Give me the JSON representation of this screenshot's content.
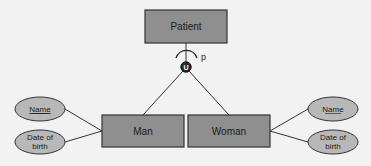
{
  "diagram": {
    "type": "EER generalization/specialization",
    "colors": {
      "background": "#f2f2f2",
      "entity_fill": "#8f8f8f",
      "attribute_fill": "#b8b8b8",
      "stroke": "#333333",
      "union_circle": "#2a2a2a"
    },
    "superclass": {
      "label": "Patient"
    },
    "specialization": {
      "symbol": "U",
      "participation_label": "p"
    },
    "subclasses": [
      {
        "label": "Man",
        "attributes": [
          {
            "label": "Name",
            "key": true
          },
          {
            "label_line1": "Date of",
            "label_line2": "birth",
            "key": false
          }
        ]
      },
      {
        "label": "Woman",
        "attributes": [
          {
            "label": "Name",
            "key": true
          },
          {
            "label_line1": "Date of",
            "label_line2": "birth",
            "key": false
          }
        ]
      }
    ]
  }
}
